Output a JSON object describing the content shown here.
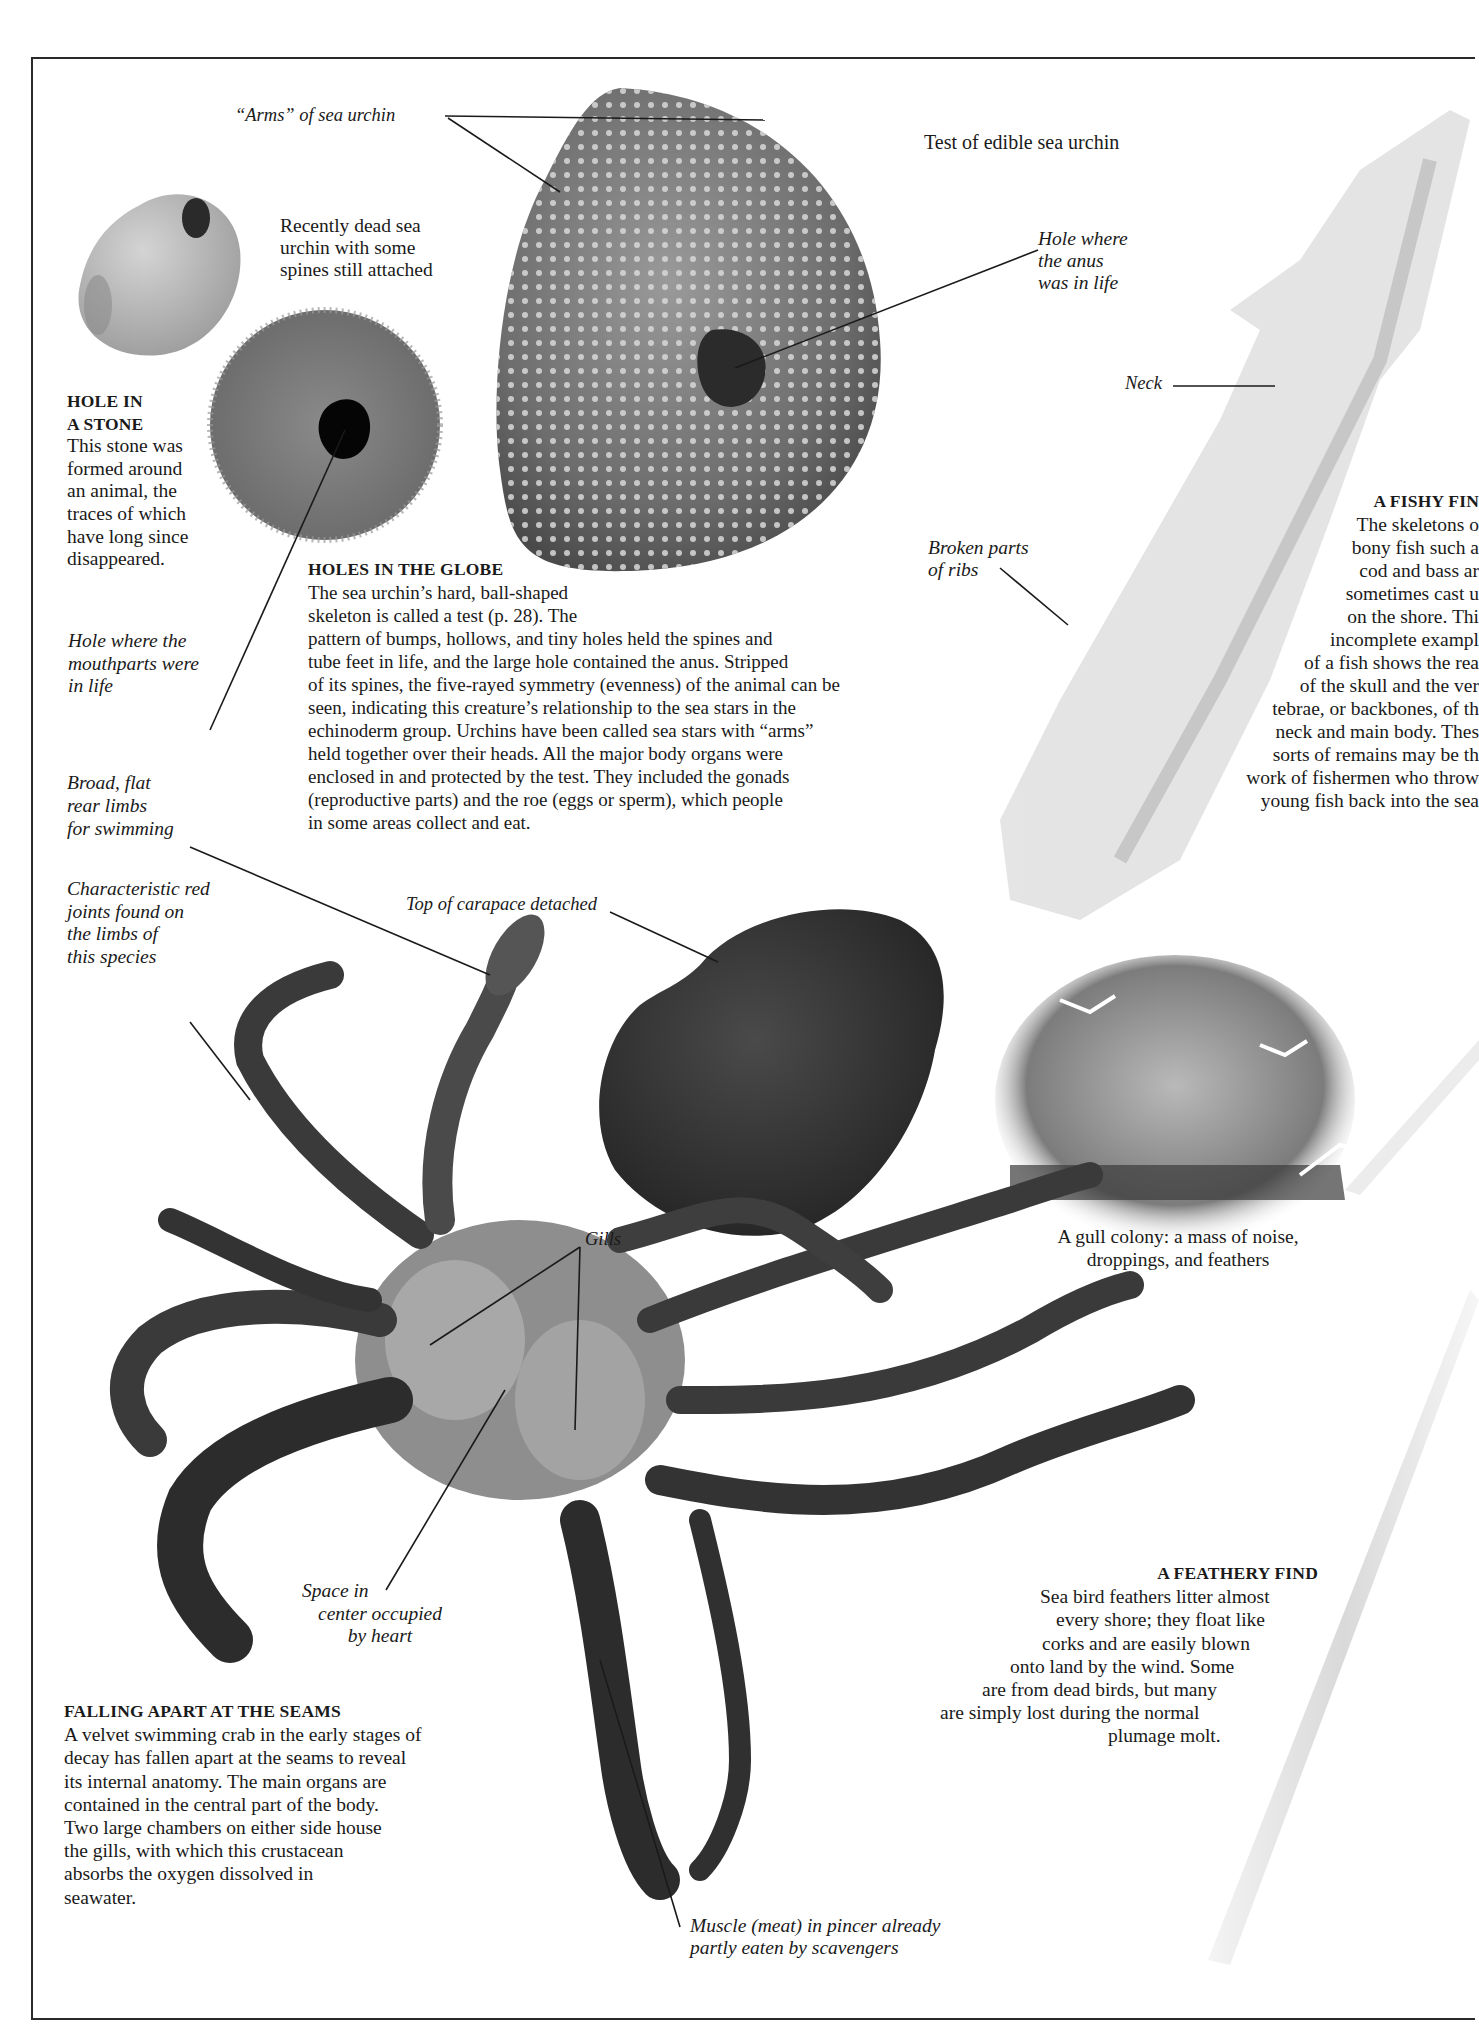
{
  "page": {
    "frame": {
      "stroke": "#2a2a2a"
    }
  },
  "labels": {
    "arms_of_sea_urchin": "“Arms” of sea urchin",
    "test_of_edible_sea_urchin": "Test of edible sea urchin",
    "recently_dead_urchin": [
      "Recently dead sea",
      "urchin with some",
      "spines still attached"
    ],
    "hole_where_anus": [
      "Hole where",
      "the anus",
      "was in life"
    ],
    "neck": "Neck",
    "broken_parts_of_ribs": [
      "Broken parts",
      "of ribs"
    ],
    "hole_where_mouthparts": [
      "Hole where the",
      "mouthparts were",
      "in life"
    ],
    "broad_flat_rear_limbs": [
      "Broad, flat",
      "rear limbs",
      "for swimming"
    ],
    "characteristic_red_joints": [
      "Characteristic red",
      "joints found  on",
      "the limbs  of",
      "this species"
    ],
    "top_of_carapace_detached": "Top of carapace detached",
    "gills": "Gills",
    "space_in_center": [
      "Space in",
      "center occupied",
      "by heart"
    ],
    "muscle_in_pincer": [
      "Muscle (meat) in pincer already",
      "partly eaten by scavengers"
    ],
    "gull_colony_caption": [
      "A gull colony: a mass of noise,",
      "droppings, and feathers"
    ]
  },
  "sections": {
    "hole_in_a_stone": {
      "heading": [
        "HOLE IN",
        "A STONE"
      ],
      "body": [
        "This stone was",
        "formed around",
        "an animal, the",
        "traces of which",
        "have long since",
        "disappeared."
      ]
    },
    "holes_in_the_globe": {
      "heading": "HOLES IN THE GLOBE",
      "body": [
        "The sea urchin’s hard, ball-shaped",
        "skeleton is called a test (p. 28). The",
        "pattern of bumps, hollows, and tiny holes held the spines and",
        "tube feet in life, and the large hole contained the anus. Stripped",
        "of its spines, the five-rayed symmetry (evenness) of the animal can be",
        "seen, indicating this creature’s relationship to the sea stars in the",
        "echinoderm group. Urchins have been called sea stars with “arms”",
        "held together over their heads. All the major body organs were",
        "enclosed in and protected by the test. They included the gonads",
        "(reproductive parts) and the roe (eggs or sperm), which people",
        "in some areas collect and eat."
      ]
    },
    "a_fishy_find": {
      "heading": "A FISHY FIN",
      "body": [
        "The skeletons o",
        "bony fish such a",
        "cod and bass ar",
        "sometimes cast u",
        "on the shore. Thi",
        "incomplete exampl",
        "of a fish shows the rea",
        "of the skull and the ver",
        "tebrae, or backbones, of th",
        "neck and main body. Thes",
        "sorts of remains may be th",
        "work of fishermen who throw",
        "young fish back into the sea"
      ]
    },
    "falling_apart_at_the_seams": {
      "heading": "FALLING APART AT THE SEAMS",
      "body": [
        "A velvet swimming crab in the early stages of",
        "decay has fallen apart at the seams to reveal",
        "its internal anatomy. The main organs are",
        "contained in the central part of the body.",
        "Two large chambers on either side house",
        "the gills, with which this crustacean",
        "absorbs the oxygen dissolved in",
        "seawater."
      ]
    },
    "a_feathery_find": {
      "heading": "A FEATHERY FIND",
      "body": [
        "Sea bird feathers litter almost",
        "every shore; they float like",
        "corks and are easily blown",
        "onto land by the wind. Some",
        "are from dead birds, but many",
        "are simply lost during the normal",
        "plumage molt."
      ]
    }
  }
}
